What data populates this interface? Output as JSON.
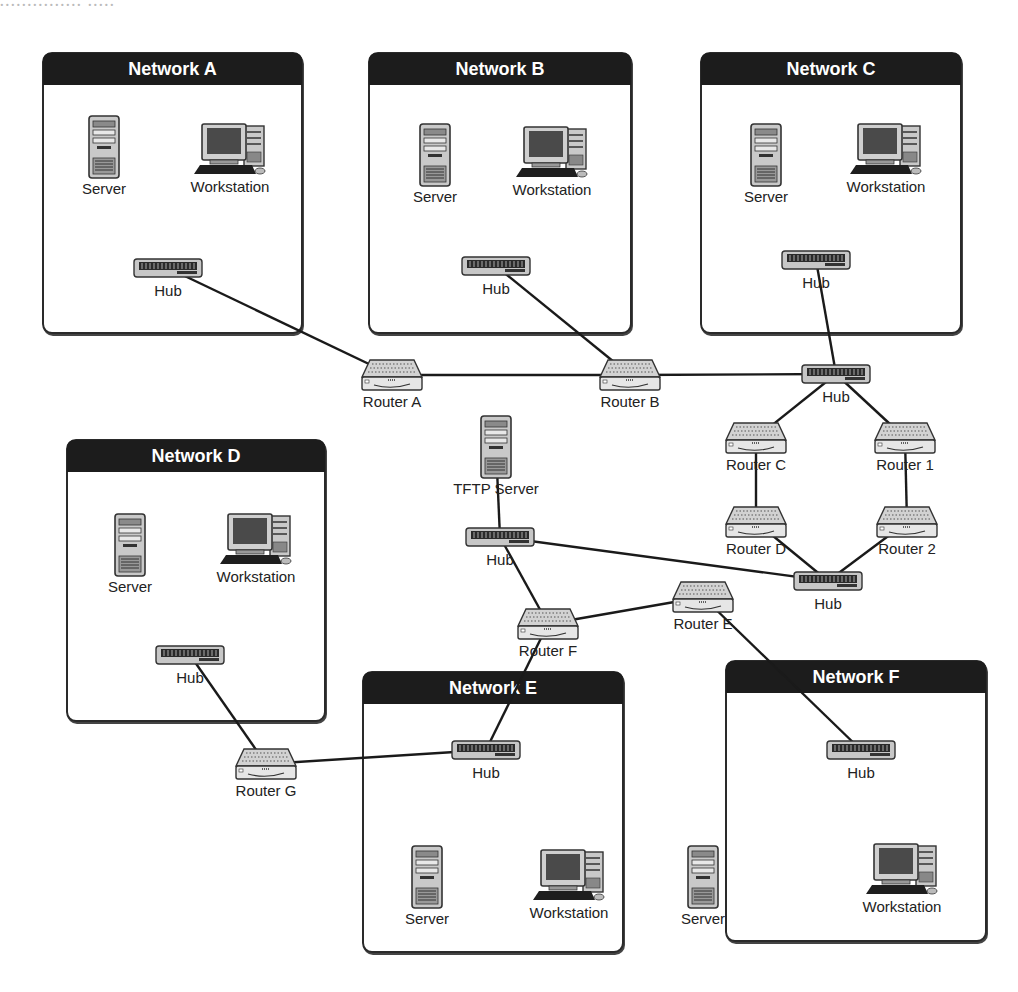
{
  "diagram": {
    "cutoff_caption": "...............  .....",
    "networks": [
      {
        "id": "A",
        "title": "Network A",
        "x": 42,
        "y": 52,
        "w": 257,
        "h": 278
      },
      {
        "id": "B",
        "title": "Network B",
        "x": 368,
        "y": 52,
        "w": 260,
        "h": 278
      },
      {
        "id": "C",
        "title": "Network C",
        "x": 700,
        "y": 52,
        "w": 258,
        "h": 278
      },
      {
        "id": "D",
        "title": "Network D",
        "x": 66,
        "y": 439,
        "w": 256,
        "h": 279
      },
      {
        "id": "E",
        "title": "Network E",
        "x": 362,
        "y": 671,
        "w": 258,
        "h": 278
      },
      {
        "id": "F",
        "title": "Network F",
        "x": 725,
        "y": 660,
        "w": 258,
        "h": 278
      }
    ],
    "nodes": {
      "serverA": {
        "type": "server",
        "label": "Server",
        "x": 104,
        "y": 147
      },
      "workstationA": {
        "type": "workstation",
        "label": "Workstation",
        "x": 230,
        "y": 150
      },
      "hubA": {
        "type": "hub",
        "label": "Hub",
        "x": 168,
        "y": 268
      },
      "serverB": {
        "type": "server",
        "label": "Server",
        "x": 435,
        "y": 155
      },
      "workstationB": {
        "type": "workstation",
        "label": "Workstation",
        "x": 552,
        "y": 153
      },
      "hubB": {
        "type": "hub",
        "label": "Hub",
        "x": 496,
        "y": 266
      },
      "serverC": {
        "type": "server",
        "label": "Server",
        "x": 766,
        "y": 155
      },
      "workstationC": {
        "type": "workstation",
        "label": "Workstation",
        "x": 886,
        "y": 150
      },
      "hubC": {
        "type": "hub",
        "label": "Hub",
        "x": 816,
        "y": 260
      },
      "serverD": {
        "type": "server",
        "label": "Server",
        "x": 130,
        "y": 545
      },
      "workstationD": {
        "type": "workstation",
        "label": "Workstation",
        "x": 256,
        "y": 540
      },
      "hubD": {
        "type": "hub",
        "label": "Hub",
        "x": 190,
        "y": 655
      },
      "hubE": {
        "type": "hub",
        "label": "Hub",
        "x": 486,
        "y": 750
      },
      "serverE": {
        "type": "server",
        "label": "Server",
        "x": 427,
        "y": 877
      },
      "workstationE": {
        "type": "workstation",
        "label": "Workstation",
        "x": 569,
        "y": 876
      },
      "hubF": {
        "type": "hub",
        "label": "Hub",
        "x": 861,
        "y": 750
      },
      "serverF": {
        "type": "server",
        "label": "Server",
        "x": 703,
        "y": 877
      },
      "workstationF": {
        "type": "workstation",
        "label": "Workstation",
        "x": 902,
        "y": 870
      },
      "routerA": {
        "type": "router",
        "label": "Router A",
        "x": 392,
        "y": 375
      },
      "routerB": {
        "type": "router",
        "label": "Router B",
        "x": 630,
        "y": 375
      },
      "hubCore": {
        "type": "hub",
        "label": "Hub",
        "x": 836,
        "y": 374
      },
      "tftp": {
        "type": "server",
        "label": "TFTP Server",
        "x": 496,
        "y": 447
      },
      "routerC": {
        "type": "router",
        "label": "Router C",
        "x": 756,
        "y": 438
      },
      "router1": {
        "type": "router",
        "label": "Router 1",
        "x": 905,
        "y": 438
      },
      "routerD": {
        "type": "router",
        "label": "Router D",
        "x": 756,
        "y": 522
      },
      "router2": {
        "type": "router",
        "label": "Router 2",
        "x": 907,
        "y": 522
      },
      "hubMid": {
        "type": "hub",
        "label": "Hub",
        "x": 500,
        "y": 537
      },
      "hubLow": {
        "type": "hub",
        "label": "Hub",
        "x": 828,
        "y": 581
      },
      "routerF": {
        "type": "router",
        "label": "Router F",
        "x": 548,
        "y": 624
      },
      "routerE": {
        "type": "router",
        "label": "Router E",
        "x": 703,
        "y": 597
      },
      "routerG": {
        "type": "router",
        "label": "Router G",
        "x": 266,
        "y": 764
      }
    },
    "links": [
      [
        "hubA",
        "routerA"
      ],
      [
        "hubB",
        "routerB"
      ],
      [
        "routerA",
        "routerB"
      ],
      [
        "routerB",
        "hubCore"
      ],
      [
        "hubC",
        "hubCore"
      ],
      [
        "hubCore",
        "routerC"
      ],
      [
        "hubCore",
        "router1"
      ],
      [
        "routerC",
        "routerD"
      ],
      [
        "router1",
        "router2"
      ],
      [
        "routerD",
        "hubLow"
      ],
      [
        "router2",
        "hubLow"
      ],
      [
        "tftp",
        "hubMid"
      ],
      [
        "hubMid",
        "hubLow"
      ],
      [
        "hubMid",
        "routerF"
      ],
      [
        "routerF",
        "routerE"
      ],
      [
        "routerE",
        "hubF"
      ],
      [
        "routerF",
        "hubE"
      ],
      [
        "hubD",
        "routerG"
      ],
      [
        "routerG",
        "hubE"
      ]
    ],
    "colors": {
      "header_bg": "#1c1c1c",
      "line": "#1a1a1a",
      "border": "#2a2a2a"
    }
  }
}
